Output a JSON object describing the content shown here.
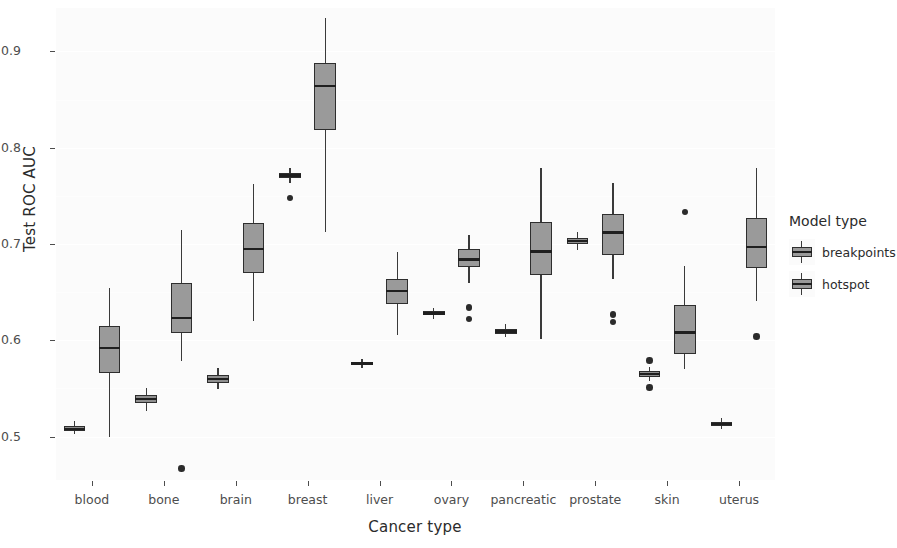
{
  "chart_data": {
    "type": "box",
    "title": "",
    "xlabel": "Cancer type",
    "ylabel": "Test ROC AUC",
    "ylim": [
      0.455,
      0.945
    ],
    "yticks": [
      0.5,
      0.6,
      0.7,
      0.8,
      0.9
    ],
    "ytick_labels": [
      "0.5",
      "0.6",
      "0.7",
      "0.8",
      "0.9"
    ],
    "grid": true,
    "legend": {
      "title": "Model type",
      "position": "right",
      "entries": [
        "breakpoints",
        "hotspot"
      ]
    },
    "categories": [
      "blood",
      "bone",
      "brain",
      "breast",
      "liver",
      "ovary",
      "pancreatic",
      "prostate",
      "skin",
      "uterus"
    ],
    "series": [
      {
        "name": "breakpoints",
        "color": "#8f8f8f",
        "boxes": [
          {
            "category": "blood",
            "whisker_low": 0.503,
            "q1": 0.506,
            "median": 0.508,
            "q3": 0.511,
            "whisker_high": 0.516,
            "outliers": []
          },
          {
            "category": "bone",
            "whisker_low": 0.527,
            "q1": 0.535,
            "median": 0.539,
            "q3": 0.543,
            "whisker_high": 0.551,
            "outliers": []
          },
          {
            "category": "brain",
            "whisker_low": 0.549,
            "q1": 0.556,
            "median": 0.56,
            "q3": 0.564,
            "whisker_high": 0.571,
            "outliers": []
          },
          {
            "category": "breast",
            "whisker_low": 0.763,
            "q1": 0.768,
            "median": 0.771,
            "q3": 0.774,
            "whisker_high": 0.779,
            "outliers": [
              0.748
            ]
          },
          {
            "category": "liver",
            "whisker_low": 0.571,
            "q1": 0.574,
            "median": 0.576,
            "q3": 0.578,
            "whisker_high": 0.581,
            "outliers": []
          },
          {
            "category": "ovary",
            "whisker_low": 0.622,
            "q1": 0.626,
            "median": 0.628,
            "q3": 0.63,
            "whisker_high": 0.634,
            "outliers": []
          },
          {
            "category": "pancreatic",
            "whisker_low": 0.603,
            "q1": 0.607,
            "median": 0.609,
            "q3": 0.612,
            "whisker_high": 0.617,
            "outliers": []
          },
          {
            "category": "prostate",
            "whisker_low": 0.694,
            "q1": 0.7,
            "median": 0.703,
            "q3": 0.706,
            "whisker_high": 0.712,
            "outliers": []
          },
          {
            "category": "skin",
            "whisker_low": 0.558,
            "q1": 0.562,
            "median": 0.565,
            "q3": 0.568,
            "whisker_high": 0.572,
            "outliers": [
              0.579,
              0.551
            ]
          },
          {
            "category": "uterus",
            "whisker_low": 0.508,
            "q1": 0.511,
            "median": 0.513,
            "q3": 0.515,
            "whisker_high": 0.519,
            "outliers": []
          }
        ]
      },
      {
        "name": "hotspot",
        "color": "#9a9a9a",
        "boxes": [
          {
            "category": "blood",
            "whisker_low": 0.5,
            "q1": 0.566,
            "median": 0.592,
            "q3": 0.615,
            "whisker_high": 0.654,
            "outliers": []
          },
          {
            "category": "bone",
            "whisker_low": 0.579,
            "q1": 0.608,
            "median": 0.623,
            "q3": 0.659,
            "whisker_high": 0.715,
            "outliers": [
              0.467
            ]
          },
          {
            "category": "brain",
            "whisker_low": 0.62,
            "q1": 0.67,
            "median": 0.695,
            "q3": 0.722,
            "whisker_high": 0.762,
            "outliers": []
          },
          {
            "category": "breast",
            "whisker_low": 0.712,
            "q1": 0.818,
            "median": 0.864,
            "q3": 0.888,
            "whisker_high": 0.935,
            "outliers": []
          },
          {
            "category": "liver",
            "whisker_low": 0.606,
            "q1": 0.638,
            "median": 0.651,
            "q3": 0.664,
            "whisker_high": 0.692,
            "outliers": []
          },
          {
            "category": "ovary",
            "whisker_low": 0.66,
            "q1": 0.676,
            "median": 0.684,
            "q3": 0.695,
            "whisker_high": 0.709,
            "outliers": [
              0.634,
              0.622
            ]
          },
          {
            "category": "pancreatic",
            "whisker_low": 0.601,
            "q1": 0.668,
            "median": 0.692,
            "q3": 0.723,
            "whisker_high": 0.779,
            "outliers": []
          },
          {
            "category": "prostate",
            "whisker_low": 0.664,
            "q1": 0.689,
            "median": 0.712,
            "q3": 0.731,
            "whisker_high": 0.763,
            "outliers": [
              0.627,
              0.619
            ]
          },
          {
            "category": "skin",
            "whisker_low": 0.57,
            "q1": 0.586,
            "median": 0.608,
            "q3": 0.637,
            "whisker_high": 0.677,
            "outliers": [
              0.733
            ]
          },
          {
            "category": "uterus",
            "whisker_low": 0.641,
            "q1": 0.675,
            "median": 0.697,
            "q3": 0.727,
            "whisker_high": 0.779,
            "outliers": [
              0.604
            ]
          }
        ]
      }
    ]
  }
}
